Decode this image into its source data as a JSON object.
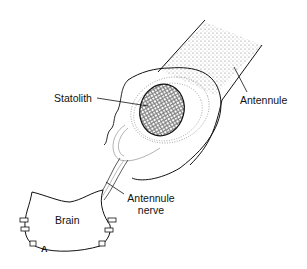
{
  "diagram": {
    "labels": {
      "statolith": "Statolith",
      "antennule": "Antennule",
      "antennule_nerve_line1": "Antennule",
      "antennule_nerve_line2": "nerve",
      "brain": "Brain",
      "figure_letter": "A"
    },
    "colors": {
      "ink": "#111111",
      "stipple": "#555555",
      "background": "#ffffff"
    }
  }
}
